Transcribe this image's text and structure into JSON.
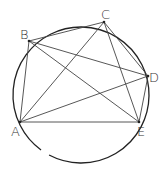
{
  "diagram": {
    "circle": {
      "cx": 81,
      "cy": 95,
      "r": 68
    },
    "points": [
      {
        "name": "A",
        "x": 20,
        "y": 122,
        "label_x": 11,
        "label_y": 136
      },
      {
        "name": "B",
        "x": 29,
        "y": 41,
        "label_x": 20,
        "label_y": 39
      },
      {
        "name": "C",
        "x": 104,
        "y": 22,
        "label_x": 101,
        "label_y": 19
      },
      {
        "name": "D",
        "x": 148,
        "y": 76,
        "label_x": 149,
        "label_y": 82
      },
      {
        "name": "E",
        "x": 139,
        "y": 122,
        "label_x": 137,
        "label_y": 136
      }
    ],
    "segments": [
      [
        "A",
        "B"
      ],
      [
        "B",
        "C"
      ],
      [
        "C",
        "D"
      ],
      [
        "D",
        "E"
      ],
      [
        "A",
        "E"
      ],
      [
        "A",
        "C"
      ],
      [
        "A",
        "D"
      ],
      [
        "B",
        "D"
      ],
      [
        "B",
        "E"
      ],
      [
        "C",
        "E"
      ]
    ],
    "line_color": "#444444",
    "circle_color": "#222222"
  }
}
